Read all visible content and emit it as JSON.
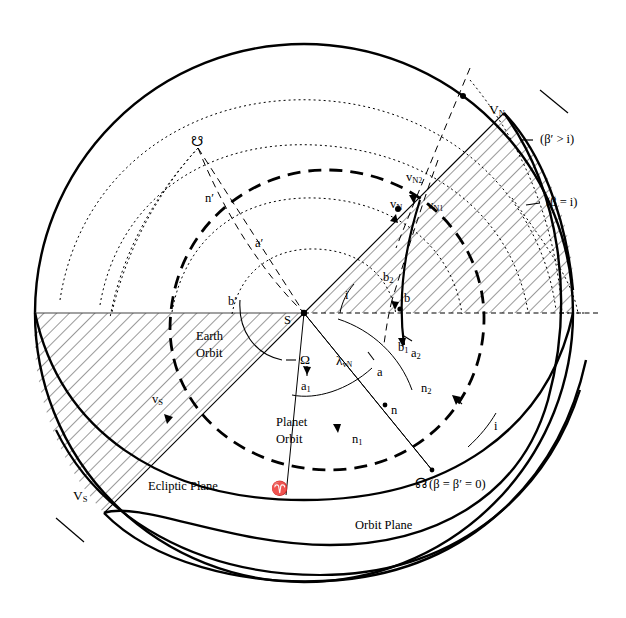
{
  "figure": {
    "kind": "celestial-sphere-orbit-geometry-diagram",
    "background": "#ffffff",
    "ink": "#000000"
  },
  "planes": {
    "ecliptic_label": "Ecliptic Plane",
    "orbit_label": "Orbit Plane",
    "earth_orbit_label_line1": "Earth",
    "earth_orbit_label_line2": "Orbit",
    "planet_orbit_label_line1": "Planet",
    "planet_orbit_label_line2": "Orbit"
  },
  "nodes": {
    "ascending_node_symbol": "☊",
    "descending_node_symbol": "☋",
    "aries_symbol": "♈",
    "ascending_node_annotation": "(β = β′ = 0)"
  },
  "points": {
    "sun": "S",
    "a": "a",
    "a1": "a",
    "a1_sub": "1",
    "a2": "a",
    "a2_sub": "2",
    "a_prime": "a′",
    "b": "b",
    "b1": "b",
    "b1_sub": "1",
    "b2": "b",
    "b2_sub": "2",
    "b_prime": "b′",
    "n": "n",
    "n1": "n",
    "n1_sub": "1",
    "n2": "n",
    "n2_sub": "2",
    "n_prime": "n′"
  },
  "velocities": {
    "VN_upper": "V",
    "VN_upper_sub": "N",
    "vN": "v",
    "vN_sub": "N",
    "vN1": "v",
    "vN1_sub": "N",
    "vN1_sub2": "1",
    "vN2": "v",
    "vN2_sub": "N",
    "vN2_sub2": "2",
    "VS_upper": "V",
    "VS_upper_sub": "S",
    "vS": "v",
    "vS_sub": "S"
  },
  "angles": {
    "inclination": "i",
    "inclination_right": "i",
    "inclination_wedge": "i",
    "omega": "Ω",
    "lambda": "λ",
    "lambda_sub": "v",
    "lambda_sub2": "N"
  },
  "conditions": {
    "beta_prime_gt_i": "(β′ > i)",
    "beta_eq_i": "(β = i)"
  },
  "geometry": {
    "center_x": 304,
    "center_y": 313,
    "radius": 269,
    "horizon_y": 313
  }
}
